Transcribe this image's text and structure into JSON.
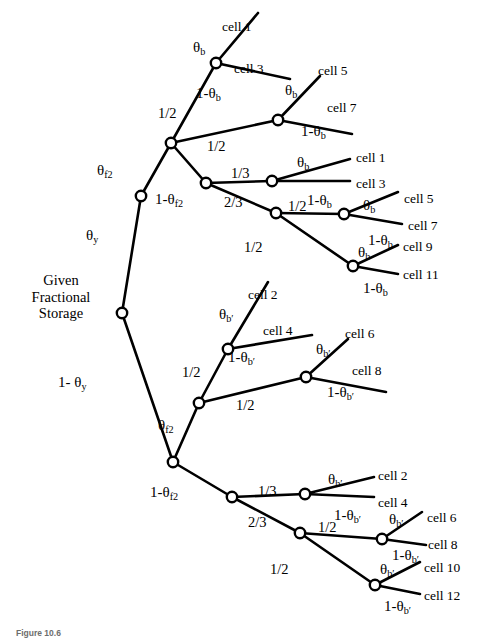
{
  "figure": {
    "caption": "Figure 10.6",
    "root_label_lines": [
      "Given",
      "Fractional",
      "Storage"
    ],
    "root_label_text": "Given Fractional Storage"
  },
  "symbols": {
    "theta_y": "θ",
    "theta_y_sub": "y",
    "one_minus_theta_y": "1- θ",
    "theta_f2": "θ",
    "theta_f2_sub": "f2",
    "one_minus_theta_f2": "1-θ",
    "theta_b": "θ",
    "theta_b_sub": "b",
    "one_minus_theta_b": "1-θ",
    "theta_bp": "θ",
    "theta_bp_sub": "b′",
    "one_minus_theta_bp": "1-θ"
  },
  "edge_labels": {
    "y_branch": "θy",
    "y_branch_complement": "1- θy",
    "f2_branch": "θf2",
    "f2_branch_complement": "1-θf2",
    "half": "1/2",
    "third": "1/3",
    "two_thirds": "2/3",
    "theta_b": "θb",
    "one_minus_theta_b": "1-θb",
    "theta_bp": "θb′",
    "one_minus_theta_bp": "1-θb′"
  },
  "labels": [
    {
      "id": "lbl-theta-y",
      "kind": "theta",
      "base": "θ",
      "sub": "y",
      "x": 86,
      "y": 228,
      "text": "θy"
    },
    {
      "id": "lbl-1-theta-y",
      "kind": "theta",
      "base": "1- θ",
      "sub": "y",
      "x": 58,
      "y": 375,
      "text": "1- θy"
    },
    {
      "id": "lbl-theta-f2-top",
      "kind": "theta",
      "base": "θ",
      "sub": "f2",
      "x": 97,
      "y": 163,
      "text": "θf2"
    },
    {
      "id": "lbl-1-theta-f2-top",
      "kind": "theta",
      "base": "1-θ",
      "sub": "f2",
      "x": 155,
      "y": 192,
      "text": "1-θf2"
    },
    {
      "id": "lbl-theta-f2-bot",
      "kind": "theta",
      "base": "θ",
      "sub": "f2",
      "x": 158,
      "y": 418,
      "text": "θf2"
    },
    {
      "id": "lbl-1-theta-f2-bot",
      "kind": "theta",
      "base": "1-θ",
      "sub": "f2",
      "x": 150,
      "y": 485,
      "text": "1-θf2"
    },
    {
      "id": "lbl-half-t1",
      "kind": "frac",
      "base": "1/2",
      "sub": "",
      "x": 158,
      "y": 106,
      "text": "1/2"
    },
    {
      "id": "lbl-half-t2",
      "kind": "frac",
      "base": "1/2",
      "sub": "",
      "x": 207,
      "y": 139,
      "text": "1/2"
    },
    {
      "id": "lbl-third-t",
      "kind": "frac",
      "base": "1/3",
      "sub": "",
      "x": 231,
      "y": 166,
      "text": "1/3"
    },
    {
      "id": "lbl-twothirds-t",
      "kind": "frac",
      "base": "2/3",
      "sub": "",
      "x": 224,
      "y": 195,
      "text": "2/3"
    },
    {
      "id": "lbl-half-t3",
      "kind": "frac",
      "base": "1/2",
      "sub": "",
      "x": 288,
      "y": 199,
      "text": "1/2"
    },
    {
      "id": "lbl-half-t4",
      "kind": "frac",
      "base": "1/2",
      "sub": "",
      "x": 244,
      "y": 240,
      "text": "1/2"
    },
    {
      "id": "lbl-half-b1",
      "kind": "frac",
      "base": "1/2",
      "sub": "",
      "x": 182,
      "y": 365,
      "text": "1/2"
    },
    {
      "id": "lbl-half-b2",
      "kind": "frac",
      "base": "1/2",
      "sub": "",
      "x": 236,
      "y": 398,
      "text": "1/2"
    },
    {
      "id": "lbl-third-b",
      "kind": "frac",
      "base": "1/3",
      "sub": "",
      "x": 258,
      "y": 484,
      "text": "1/3"
    },
    {
      "id": "lbl-twothirds-b",
      "kind": "frac",
      "base": "2/3",
      "sub": "",
      "x": 248,
      "y": 515,
      "text": "2/3"
    },
    {
      "id": "lbl-half-b3",
      "kind": "frac",
      "base": "1/2",
      "sub": "",
      "x": 318,
      "y": 520,
      "text": "1/2"
    },
    {
      "id": "lbl-half-b4",
      "kind": "frac",
      "base": "1/2",
      "sub": "",
      "x": 270,
      "y": 562,
      "text": "1/2"
    },
    {
      "id": "lbl-tb-1",
      "kind": "theta",
      "base": "θ",
      "sub": "b",
      "x": 193,
      "y": 40,
      "text": "θb"
    },
    {
      "id": "lbl-1tb-1",
      "kind": "theta",
      "base": "1-θ",
      "sub": "b",
      "x": 196,
      "y": 86,
      "text": "1-θb"
    },
    {
      "id": "lbl-tb-2",
      "kind": "theta",
      "base": "θ",
      "sub": "b",
      "x": 285,
      "y": 83,
      "text": "θb"
    },
    {
      "id": "lbl-1tb-2",
      "kind": "theta",
      "base": "1-θ",
      "sub": "b",
      "x": 301,
      "y": 124,
      "text": "1-θb"
    },
    {
      "id": "lbl-tb-3",
      "kind": "theta",
      "base": "θ",
      "sub": "b",
      "x": 297,
      "y": 155,
      "text": "θb"
    },
    {
      "id": "lbl-1tb-3",
      "kind": "theta",
      "base": "1-θ",
      "sub": "b",
      "x": 307,
      "y": 193,
      "text": "1-θb"
    },
    {
      "id": "lbl-tb-4",
      "kind": "theta",
      "base": "θ",
      "sub": "b",
      "x": 363,
      "y": 198,
      "text": "θb"
    },
    {
      "id": "lbl-1tb-4",
      "kind": "theta",
      "base": "1-θ",
      "sub": "b",
      "x": 368,
      "y": 233,
      "text": "1-θb"
    },
    {
      "id": "lbl-tb-5",
      "kind": "theta",
      "base": "θ",
      "sub": "b",
      "x": 358,
      "y": 245,
      "text": "θb"
    },
    {
      "id": "lbl-1tb-5",
      "kind": "theta",
      "base": "1-θ",
      "sub": "b",
      "x": 363,
      "y": 281,
      "text": "1-θb"
    },
    {
      "id": "lbl-tbp-1",
      "kind": "theta",
      "base": "θ",
      "sub": "b′",
      "x": 219,
      "y": 307,
      "text": "θb′"
    },
    {
      "id": "lbl-1tbp-1",
      "kind": "theta",
      "base": "1-θ",
      "sub": "b′",
      "x": 228,
      "y": 350,
      "text": "1-θb′"
    },
    {
      "id": "lbl-tbp-2",
      "kind": "theta",
      "base": "θ",
      "sub": "b′",
      "x": 316,
      "y": 342,
      "text": "θb′"
    },
    {
      "id": "lbl-1tbp-2",
      "kind": "theta",
      "base": "1-θ",
      "sub": "b′",
      "x": 327,
      "y": 385,
      "text": "1-θb′"
    },
    {
      "id": "lbl-tbp-3",
      "kind": "theta",
      "base": "θ",
      "sub": "b′",
      "x": 328,
      "y": 472,
      "text": "θb′"
    },
    {
      "id": "lbl-1tbp-3",
      "kind": "theta",
      "base": "1-θ",
      "sub": "b′",
      "x": 334,
      "y": 508,
      "text": "1-θb′"
    },
    {
      "id": "lbl-tbp-4",
      "kind": "theta",
      "base": "θ",
      "sub": "b′",
      "x": 389,
      "y": 512,
      "text": "θb′"
    },
    {
      "id": "lbl-1tbp-4",
      "kind": "theta",
      "base": "1-θ",
      "sub": "b′",
      "x": 392,
      "y": 548,
      "text": "1-θb′"
    },
    {
      "id": "lbl-tbp-5",
      "kind": "theta",
      "base": "θ",
      "sub": "b′",
      "x": 380,
      "y": 562,
      "text": "θb′"
    },
    {
      "id": "lbl-1tbp-5",
      "kind": "theta",
      "base": "1-θ",
      "sub": "b′",
      "x": 384,
      "y": 599,
      "text": "1-θb′"
    }
  ],
  "leaves": [
    {
      "id": "leaf-t1a",
      "text": "cell 1",
      "x": 222,
      "y": 20
    },
    {
      "id": "leaf-t1b",
      "text": "cell 3",
      "x": 234,
      "y": 62
    },
    {
      "id": "leaf-t2a",
      "text": "cell 5",
      "x": 318,
      "y": 64
    },
    {
      "id": "leaf-t2b",
      "text": "cell 7",
      "x": 327,
      "y": 101
    },
    {
      "id": "leaf-t3a",
      "text": "cell 1",
      "x": 356,
      "y": 151
    },
    {
      "id": "leaf-t3b",
      "text": "cell 3",
      "x": 356,
      "y": 177
    },
    {
      "id": "leaf-t4a",
      "text": "cell 5",
      "x": 404,
      "y": 192
    },
    {
      "id": "leaf-t4b",
      "text": "cell 7",
      "x": 408,
      "y": 219
    },
    {
      "id": "leaf-t5a",
      "text": "cell 9",
      "x": 403,
      "y": 240
    },
    {
      "id": "leaf-t5b",
      "text": "cell 11",
      "x": 403,
      "y": 268
    },
    {
      "id": "leaf-b1a",
      "text": "cell 2",
      "x": 248,
      "y": 288
    },
    {
      "id": "leaf-b1b",
      "text": "cell 4",
      "x": 263,
      "y": 324
    },
    {
      "id": "leaf-b2a",
      "text": "cell 6",
      "x": 345,
      "y": 327
    },
    {
      "id": "leaf-b2b",
      "text": "cell 8",
      "x": 352,
      "y": 364
    },
    {
      "id": "leaf-b3a",
      "text": "cell 2",
      "x": 378,
      "y": 469
    },
    {
      "id": "leaf-b3b",
      "text": "cell 4",
      "x": 378,
      "y": 496
    },
    {
      "id": "leaf-b4a",
      "text": "cell 6",
      "x": 427,
      "y": 511
    },
    {
      "id": "leaf-b4b",
      "text": "cell 8",
      "x": 428,
      "y": 538
    },
    {
      "id": "leaf-b5a",
      "text": "cell 10",
      "x": 424,
      "y": 561
    },
    {
      "id": "leaf-b5b",
      "text": "cell 12",
      "x": 424,
      "y": 589
    }
  ],
  "tree": {
    "nodes": [
      {
        "id": "root",
        "x": 122,
        "y": 313,
        "r": 5.2
      },
      {
        "id": "t-y",
        "x": 141,
        "y": 196,
        "r": 5.2
      },
      {
        "id": "t-f2",
        "x": 171,
        "y": 143,
        "r": 5.2
      },
      {
        "id": "t-a",
        "x": 278,
        "y": 120,
        "r": 5.2
      },
      {
        "id": "t-nf2",
        "x": 206,
        "y": 183,
        "r": 5.2
      },
      {
        "id": "t-b",
        "x": 272,
        "y": 181,
        "r": 5.2
      },
      {
        "id": "t-c",
        "x": 276,
        "y": 213,
        "r": 5.2
      },
      {
        "id": "t-d",
        "x": 344,
        "y": 214,
        "r": 5.2
      },
      {
        "id": "t-e",
        "x": 353,
        "y": 266,
        "r": 5.2
      },
      {
        "id": "b-f2",
        "x": 173,
        "y": 462,
        "r": 5.2
      },
      {
        "id": "b-a",
        "x": 199,
        "y": 403,
        "r": 5.2
      },
      {
        "id": "b-b",
        "x": 228,
        "y": 349,
        "r": 5.2
      },
      {
        "id": "b-c",
        "x": 306,
        "y": 377,
        "r": 5.2
      },
      {
        "id": "b-nf2",
        "x": 232,
        "y": 497,
        "r": 5.2
      },
      {
        "id": "b-d",
        "x": 305,
        "y": 494,
        "r": 5.2
      },
      {
        "id": "b-e",
        "x": 300,
        "y": 533,
        "r": 5.2
      },
      {
        "id": "b-f",
        "x": 382,
        "y": 539,
        "r": 5.2
      },
      {
        "id": "b-g",
        "x": 375,
        "y": 585,
        "r": 5.2
      }
    ],
    "edge_count": 32,
    "leaf_count": 20
  }
}
